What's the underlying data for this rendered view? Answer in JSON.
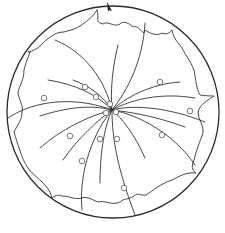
{
  "diagram": {
    "type": "stereonet",
    "colors": {
      "line": "#333333",
      "outer": "#2a2a2a",
      "pole": "#555555",
      "background": "#ffffff"
    },
    "primitive_circle": {
      "cx": 113,
      "cy": 112,
      "r": 106
    },
    "north_marker": {
      "x": 108,
      "y": 4,
      "icon": "north-arrow"
    },
    "scallop_boundary": "M97,10 C100,18 94,22 103,24 C108,20 114,28 120,24 C124,20 130,24 133,27 C137,25 140,30 144,33 L145,30 C150,34 158,36 162,33 C168,36 172,30 172,30 C174,40 178,42 182,48 C186,56 190,60 194,70 C196,80 196,88 200,95 C206,96 214,96 214,96 C208,100 200,104 198,112 C198,120 206,128 202,136 C198,146 196,152 194,160 C190,168 194,172 196,173 C186,172 180,176 172,180 C160,184 154,190 146,195 C140,196 138,192 134,196 C128,200 124,198 120,202 C112,206 106,200 98,202 C92,200 88,196 82,198 C74,200 70,196 62,196 C58,194 54,196 52,198 C50,190 46,186 42,182 C36,176 30,172 28,168 C24,162 22,158 14,132 C18,124 22,120 22,112 C24,106 18,98 18,92 C20,84 24,80 24,70 C26,62 28,58 30,52 L28,52 C38,50 42,44 46,40 C52,36 56,32 64,32 C70,30 74,30 80,26 C86,22 92,18 97,10",
    "great_circles": [
      "M55,40 C85,52 105,80 112,110",
      "M118,45 C113,65 110,90 112,110",
      "M145,23 C143,60 128,90 112,110",
      "M48,80 C75,84 98,95 112,110",
      "M73,80 C90,86 103,96 112,110",
      "M8,118 C35,100 75,96 112,110",
      "M40,116 C65,108 90,104 112,110",
      "M180,82 C150,84 125,98 112,110",
      "M195,98 C160,92 130,100 112,110",
      "M205,122 C170,108 135,104 112,110",
      "M185,127 C155,116 130,112 112,110",
      "M195,165 C175,135 140,115 112,110",
      "M145,158 C135,135 122,118 112,110",
      "M40,148 C60,130 88,116 112,110",
      "M63,160 C78,138 98,120 112,110",
      "M100,183 C100,150 105,125 112,110",
      "M82,210 C78,170 95,130 112,110",
      "M135,215 C118,170 112,140 112,110"
    ],
    "poles": [
      {
        "cx": 44,
        "cy": 98
      },
      {
        "cx": 85,
        "cy": 87
      },
      {
        "cx": 96,
        "cy": 97
      },
      {
        "cx": 110,
        "cy": 104
      },
      {
        "cx": 106,
        "cy": 113
      },
      {
        "cx": 116,
        "cy": 112
      },
      {
        "cx": 160,
        "cy": 82
      },
      {
        "cx": 190,
        "cy": 111
      },
      {
        "cx": 70,
        "cy": 136
      },
      {
        "cx": 100,
        "cy": 139
      },
      {
        "cx": 117,
        "cy": 139
      },
      {
        "cx": 162,
        "cy": 135
      },
      {
        "cx": 82,
        "cy": 161
      },
      {
        "cx": 124,
        "cy": 188
      }
    ]
  }
}
